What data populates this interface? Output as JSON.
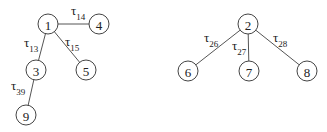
{
  "diagram": {
    "trees": [
      {
        "name": "tree-1",
        "nodes": [
          {
            "id": "1",
            "label": "1",
            "x": 48,
            "y": 24
          },
          {
            "id": "4",
            "label": "4",
            "x": 99,
            "y": 24
          },
          {
            "id": "3",
            "label": "3",
            "x": 36,
            "y": 70
          },
          {
            "id": "5",
            "label": "5",
            "x": 86,
            "y": 70
          },
          {
            "id": "9",
            "label": "9",
            "x": 26,
            "y": 115
          }
        ],
        "edges": [
          {
            "from": "1",
            "to": "4",
            "symbol": "τ",
            "sub": "14",
            "lx": 71,
            "ly": 15
          },
          {
            "from": "1",
            "to": "3",
            "symbol": "τ",
            "sub": "13",
            "lx": 24,
            "ly": 47
          },
          {
            "from": "1",
            "to": "5",
            "symbol": "τ",
            "sub": "15",
            "lx": 65,
            "ly": 46
          },
          {
            "from": "3",
            "to": "9",
            "symbol": "τ",
            "sub": "39",
            "lx": 11,
            "ly": 90
          }
        ]
      },
      {
        "name": "tree-2",
        "nodes": [
          {
            "id": "2",
            "label": "2",
            "x": 248,
            "y": 24
          },
          {
            "id": "6",
            "label": "6",
            "x": 188,
            "y": 71
          },
          {
            "id": "7",
            "label": "7",
            "x": 249,
            "y": 71
          },
          {
            "id": "8",
            "label": "8",
            "x": 307,
            "y": 71
          }
        ],
        "edges": [
          {
            "from": "2",
            "to": "6",
            "symbol": "τ",
            "sub": "26",
            "lx": 204,
            "ly": 42
          },
          {
            "from": "2",
            "to": "7",
            "symbol": "τ",
            "sub": "27",
            "lx": 232,
            "ly": 50
          },
          {
            "from": "2",
            "to": "8",
            "symbol": "τ",
            "sub": "28",
            "lx": 273,
            "ly": 42
          }
        ]
      }
    ],
    "node_radius": 10
  }
}
